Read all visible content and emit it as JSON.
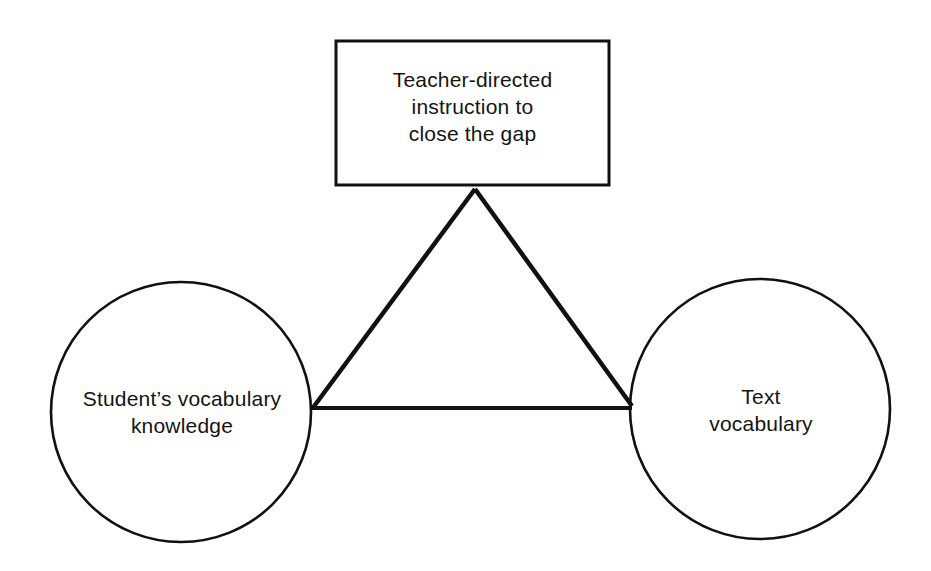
{
  "diagram": {
    "type": "relationship-triangle",
    "nodes": {
      "top_box": {
        "shape": "rectangle",
        "lines": [
          "Teacher-directed",
          "instruction to",
          "close the gap"
        ]
      },
      "left_circle": {
        "shape": "circle",
        "lines": [
          "Student’s vocabulary",
          "knowledge"
        ]
      },
      "right_circle": {
        "shape": "circle",
        "lines": [
          "Text",
          "vocabulary"
        ]
      }
    },
    "edges": [
      {
        "from": "top_box",
        "to": "left_circle"
      },
      {
        "from": "top_box",
        "to": "right_circle"
      },
      {
        "from": "left_circle",
        "to": "right_circle"
      }
    ],
    "colors": {
      "stroke": "#111111",
      "text": "#141414",
      "background": "#ffffff"
    }
  }
}
